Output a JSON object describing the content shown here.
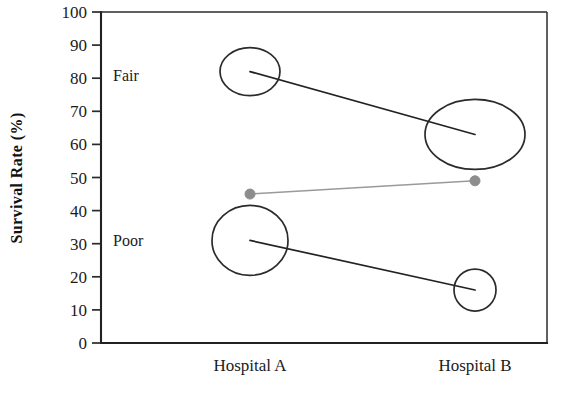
{
  "chart_data": {
    "type": "line",
    "title": "",
    "xlabel": "",
    "ylabel": "Survival Rate (%)",
    "categories": [
      "Hospital A",
      "Hospital B"
    ],
    "x_positions": [
      250,
      475
    ],
    "ylim": [
      0,
      100
    ],
    "y_ticks": [
      0,
      10,
      20,
      30,
      40,
      50,
      60,
      70,
      80,
      90,
      100
    ],
    "y_tick_labels": [
      "0",
      "10",
      "20",
      "30",
      "40",
      "50",
      "60",
      "70",
      "80",
      "90",
      "100"
    ],
    "grid": false,
    "legend": "none",
    "in_plot_labels": [
      {
        "text": "Fair",
        "x_px": 113,
        "y_value": 81
      },
      {
        "text": "Poor",
        "x_px": 113,
        "y_value": 31
      }
    ],
    "series": [
      {
        "name": "Fair",
        "marker": "ellipse",
        "color": "#2b2b2b",
        "values": [
          82,
          63
        ],
        "marker_rx": [
          30,
          50
        ],
        "marker_ry": [
          24,
          35
        ]
      },
      {
        "name": "Poor",
        "marker": "ellipse",
        "color": "#2b2b2b",
        "values": [
          31,
          16
        ],
        "marker_rx": [
          38,
          21
        ],
        "marker_ry": [
          35,
          21
        ]
      },
      {
        "name": "Middle",
        "marker": "dot",
        "color": "#8d8d8d",
        "values": [
          45,
          49
        ],
        "marker_rx": [
          5,
          5
        ],
        "marker_ry": [
          5,
          5
        ]
      }
    ]
  },
  "axes": {
    "plot_left_px": 101,
    "plot_right_px": 547,
    "plot_top_px": 12,
    "plot_bottom_px": 343
  }
}
